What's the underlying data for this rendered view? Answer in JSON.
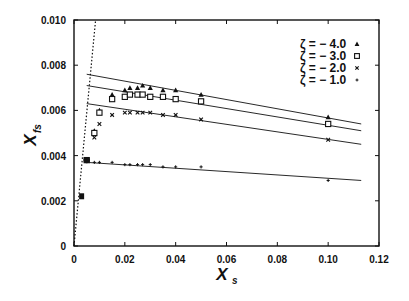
{
  "chart_data": {
    "type": "scatter",
    "title": "",
    "xlabel": "X_s",
    "ylabel": "X_fs",
    "xlim": [
      0,
      0.12
    ],
    "ylim": [
      0,
      0.01
    ],
    "xticks": [
      "0",
      "0.02",
      "0.04",
      "0.06",
      "0.08",
      "0.10",
      "0.12"
    ],
    "yticks": [
      "0",
      "0.002",
      "0.004",
      "0.006",
      "0.008",
      "0.010"
    ],
    "grid": false,
    "legend_position": "upper right",
    "series": [
      {
        "name": "ζ = − 4.0",
        "marker": "triangle",
        "x": [
          0.005,
          0.008,
          0.01,
          0.015,
          0.02,
          0.022,
          0.025,
          0.027,
          0.03,
          0.035,
          0.04,
          0.05,
          0.1
        ],
        "y": [
          0.0038,
          0.0051,
          0.006,
          0.0067,
          0.0069,
          0.007,
          0.007,
          0.0071,
          0.007,
          0.0069,
          0.0069,
          0.0067,
          0.0057
        ],
        "fit_line": {
          "x": [
            0.005,
            0.113
          ],
          "y": [
            0.0076,
            0.0054
          ]
        }
      },
      {
        "name": "ζ = − 3.0",
        "marker": "square",
        "x": [
          0.005,
          0.008,
          0.01,
          0.015,
          0.02,
          0.022,
          0.025,
          0.027,
          0.03,
          0.035,
          0.04,
          0.05,
          0.1
        ],
        "y": [
          0.0038,
          0.005,
          0.0059,
          0.0065,
          0.0066,
          0.0067,
          0.0067,
          0.0067,
          0.0066,
          0.0066,
          0.0065,
          0.0064,
          0.0054
        ],
        "fit_line": {
          "x": [
            0.005,
            0.113
          ],
          "y": [
            0.0071,
            0.0051
          ]
        }
      },
      {
        "name": "ζ = − 2.0",
        "marker": "x",
        "x": [
          0.005,
          0.008,
          0.01,
          0.015,
          0.02,
          0.022,
          0.025,
          0.027,
          0.03,
          0.035,
          0.04,
          0.05,
          0.1
        ],
        "y": [
          0.0038,
          0.0048,
          0.0054,
          0.0058,
          0.0059,
          0.0059,
          0.0059,
          0.0059,
          0.0059,
          0.0058,
          0.0058,
          0.0056,
          0.0047
        ],
        "fit_line": {
          "x": [
            0.005,
            0.113
          ],
          "y": [
            0.0063,
            0.0045
          ]
        }
      },
      {
        "name": "ζ = − 1.0",
        "marker": "plus",
        "x": [
          0.003,
          0.005,
          0.008,
          0.01,
          0.015,
          0.02,
          0.022,
          0.025,
          0.027,
          0.03,
          0.035,
          0.04,
          0.05,
          0.1
        ],
        "y": [
          0.0022,
          0.0038,
          0.0037,
          0.0037,
          0.0037,
          0.0036,
          0.0036,
          0.0036,
          0.0036,
          0.0036,
          0.0035,
          0.0035,
          0.0035,
          0.0029
        ],
        "fit_line": {
          "x": [
            0.005,
            0.113
          ],
          "y": [
            0.0037,
            0.0029
          ]
        }
      }
    ],
    "reference_line": {
      "style": "dotted",
      "x": [
        0,
        0.0085
      ],
      "y": [
        0,
        0.01
      ]
    },
    "colors": {
      "ink": "#111111",
      "background": "#ffffff"
    }
  }
}
